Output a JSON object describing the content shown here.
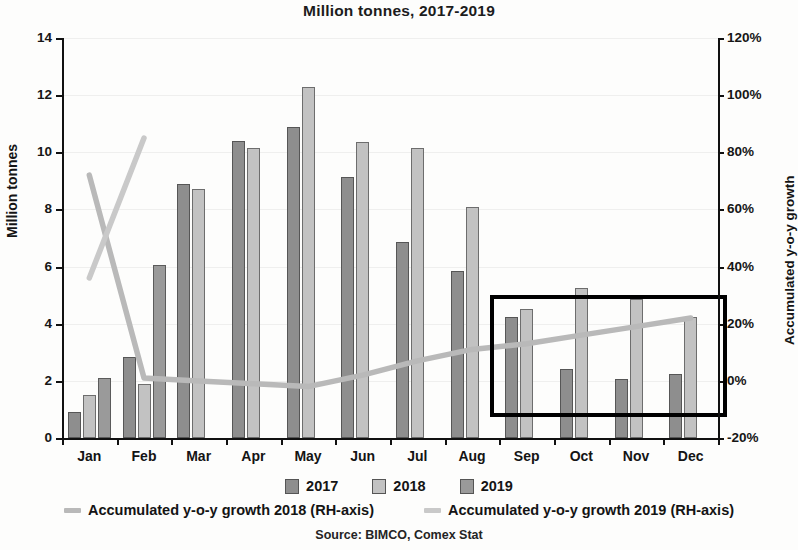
{
  "chart_data": {
    "type": "bar",
    "title": "Million tonnes, 2017-2019",
    "subtitle": "",
    "xlabel": "",
    "ylabel": "Million tonnes",
    "y2label": "Accumulated y-o-y growth",
    "categories": [
      "Jan",
      "Feb",
      "Mar",
      "Apr",
      "May",
      "Jun",
      "Jul",
      "Aug",
      "Sep",
      "Oct",
      "Nov",
      "Dec"
    ],
    "ylim": [
      0,
      14
    ],
    "yticks": [
      0,
      2,
      4,
      6,
      8,
      10,
      12,
      14
    ],
    "ytick_labels": [
      "0",
      "2",
      "4",
      "6",
      "8",
      "10",
      "12",
      "14"
    ],
    "y2lim": [
      -20,
      120
    ],
    "y2ticks": [
      -20,
      0,
      20,
      40,
      60,
      80,
      100,
      120
    ],
    "y2tick_labels": [
      "-20%",
      "0%",
      "20%",
      "40%",
      "60%",
      "80%",
      "100%",
      "120%"
    ],
    "grid": true,
    "legend_position": "bottom",
    "series": [
      {
        "name": "2017",
        "kind": "bar",
        "axis": "left",
        "color": "#8e8e8e",
        "values": [
          0.9,
          2.85,
          8.9,
          10.4,
          10.9,
          9.15,
          6.85,
          5.85,
          4.25,
          2.4,
          2.05,
          2.25
        ]
      },
      {
        "name": "2018",
        "kind": "bar",
        "axis": "left",
        "color": "#c2c2c2",
        "values": [
          1.5,
          1.9,
          8.7,
          10.15,
          12.3,
          10.35,
          10.15,
          8.1,
          4.5,
          5.25,
          4.85,
          4.25
        ]
      },
      {
        "name": "2019",
        "kind": "bar",
        "axis": "left",
        "color": "#9a9a9a",
        "values": [
          2.1,
          6.05,
          null,
          null,
          null,
          null,
          null,
          null,
          null,
          null,
          null,
          null
        ]
      },
      {
        "name": "Accumulated y-o-y growth 2018 (RH-axis)",
        "kind": "line",
        "axis": "right",
        "color": "#b9b9b9",
        "values": [
          72,
          1,
          0,
          -1,
          -2,
          2,
          7,
          11,
          13,
          16,
          19,
          22
        ]
      },
      {
        "name": "Accumulated y-o-y growth 2019 (RH-axis)",
        "kind": "line",
        "axis": "right",
        "color": "#c9c9c9",
        "values": [
          36,
          85,
          null,
          null,
          null,
          null,
          null,
          null,
          null,
          null,
          null,
          null
        ]
      }
    ],
    "annotations": [
      {
        "name": "highlight-box",
        "type": "rectangle",
        "covers_categories": [
          "Sep",
          "Oct",
          "Nov",
          "Dec"
        ],
        "color": "#000000"
      }
    ],
    "source": "Source: BIMCO, Comex Stat"
  },
  "legend": {
    "bars": [
      {
        "label": "2017",
        "color": "#8e8e8e"
      },
      {
        "label": "2018",
        "color": "#c2c2c2"
      },
      {
        "label": "2019",
        "color": "#9a9a9a"
      }
    ],
    "lines": [
      {
        "label": "Accumulated y-o-y growth 2018 (RH-axis)",
        "color": "#b9b9b9"
      },
      {
        "label": "Accumulated y-o-y growth 2019 (RH-axis)",
        "color": "#c9c9c9"
      }
    ]
  },
  "source_note": "Source: BIMCO, Comex Stat"
}
